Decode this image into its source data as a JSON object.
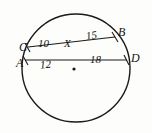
{
  "figure": {
    "type": "circle-with-two-intersecting-chords",
    "background_color": "#fdfdfc",
    "stroke_color": "#1a1a1a",
    "circle": {
      "center_x": 76,
      "center_y": 68,
      "radius": 54,
      "center_dot_x": 74,
      "center_dot_y": 69,
      "center_dot_radius": 1.6
    },
    "points": {
      "A": {
        "label": "A",
        "x": 25,
        "y": 60
      },
      "B": {
        "label": "B",
        "x": 115,
        "y": 37
      },
      "C": {
        "label": "C",
        "x": 28,
        "y": 47
      },
      "D": {
        "label": "D",
        "x": 127,
        "y": 60
      },
      "X": {
        "label": "X",
        "x": 67,
        "y": 53
      }
    },
    "chords": [
      {
        "name": "chord-CB",
        "from": "C",
        "to": "B"
      },
      {
        "name": "chord-AD",
        "from": "A",
        "to": "D"
      }
    ],
    "segment_measures": {
      "CX": "10",
      "XB": "15",
      "AX": "12",
      "XD": "18"
    }
  }
}
